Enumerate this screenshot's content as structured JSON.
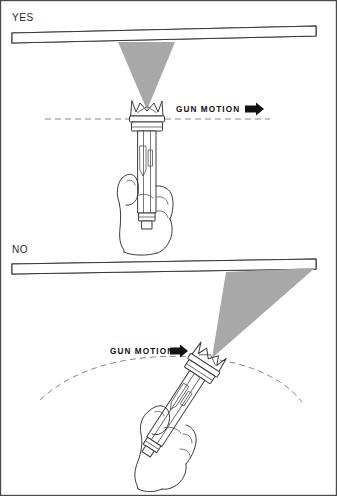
{
  "figure": {
    "width": 337,
    "height": 496,
    "background_color": "#ffffff",
    "border_color": "#4a4a4a"
  },
  "colors": {
    "spray_fan": "#a8a8a8",
    "line_ink": "#3b3b3b",
    "dashed_guide": "#7c7c7c",
    "hatch": "#3a3a3a",
    "arrow": "#111111",
    "label_text": "#2a2a2a"
  },
  "panels": [
    {
      "id": "yes",
      "label": "YES",
      "verdict": "correct",
      "motion_label": "GUN MOTION",
      "motion_arrow_icon": "arrow-right-solid-icon",
      "guide_type": "straight-dashed-line",
      "gun_orientation": "perpendicular",
      "gun_angle_degrees": 0,
      "spray_fan_shape": "symmetric-vertical-triangle",
      "surface_icon": "hatched-panel-icon",
      "hand_icon": "hand-grip-icon"
    },
    {
      "id": "no",
      "label": "NO",
      "verdict": "incorrect",
      "motion_label": "GUN MOTION",
      "motion_arrow_icon": "arrow-right-solid-icon",
      "guide_type": "curved-dashed-arc",
      "gun_orientation": "tilted",
      "gun_angle_degrees": 33,
      "spray_fan_shape": "skewed-oblique-triangle",
      "surface_icon": "hatched-panel-icon",
      "hand_icon": "hand-grip-icon"
    }
  ]
}
